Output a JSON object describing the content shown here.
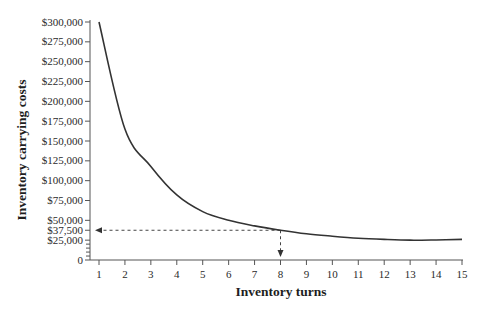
{
  "chart_data": {
    "type": "line",
    "title": "",
    "xlabel": "Inventory turns",
    "ylabel": "Inventory carrying costs",
    "x": [
      1,
      2,
      3,
      4,
      5,
      6,
      7,
      8,
      9,
      10,
      11,
      12,
      13,
      14,
      15
    ],
    "series": [
      {
        "name": "Inventory carrying costs",
        "values": [
          300000,
          165000,
          118000,
          82000,
          61000,
          50000,
          43000,
          37500,
          33000,
          30000,
          27500,
          26000,
          25000,
          25300,
          26000
        ]
      }
    ],
    "xlim": [
      1,
      15
    ],
    "ylim": [
      0,
      300000
    ],
    "x_ticks": [
      "1",
      "2",
      "3",
      "4",
      "5",
      "6",
      "7",
      "8",
      "9",
      "10",
      "11",
      "12",
      "13",
      "14",
      "15"
    ],
    "y_ticks": [
      {
        "value": 300000,
        "label": "$300,000"
      },
      {
        "value": 275000,
        "label": "$275,000"
      },
      {
        "value": 250000,
        "label": "$250,000"
      },
      {
        "value": 225000,
        "label": "$225,000"
      },
      {
        "value": 200000,
        "label": "$200,000"
      },
      {
        "value": 175000,
        "label": "$175,000"
      },
      {
        "value": 150000,
        "label": "$150,000"
      },
      {
        "value": 125000,
        "label": "$125,000"
      },
      {
        "value": 100000,
        "label": "$100,000"
      },
      {
        "value": 75000,
        "label": "$75,000"
      },
      {
        "value": 50000,
        "label": "$50,000"
      },
      {
        "value": 37500,
        "label": "$37,500"
      },
      {
        "value": 25000,
        "label": "$25,000"
      },
      {
        "value": 0,
        "label": "0"
      }
    ],
    "y_minor_ticks": [
      5000,
      10000,
      15000,
      20000
    ],
    "annotations": [
      {
        "type": "dashed-arrow-horizontal",
        "from_x": 8,
        "to_x": 1,
        "y": 37500
      },
      {
        "type": "dashed-arrow-vertical",
        "x": 8,
        "from_y": 37500,
        "to_y": 0
      }
    ],
    "grid": false,
    "legend": "none",
    "colors": {
      "line": "#333333",
      "axis": "#555555",
      "text": "#2a2a2a"
    }
  }
}
